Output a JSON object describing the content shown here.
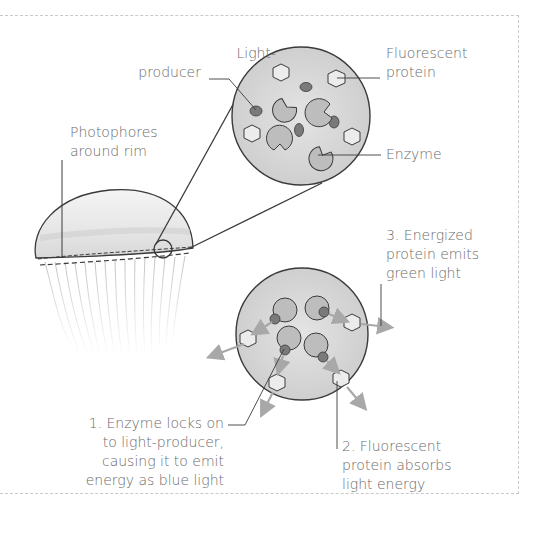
{
  "diagram": {
    "labels": {
      "light_producer": [
        "Light-",
        "producer"
      ],
      "fluorescent_protein": [
        "Fluorescent",
        "protein"
      ],
      "photophores": [
        "Photophores",
        "around rim"
      ],
      "enzyme": "Enzyme",
      "step3": [
        "3. Energized",
        "protein emits",
        "green light"
      ],
      "step1": [
        "1. Enzyme locks on",
        "to light-producer,",
        "causing it to emit",
        "energy as blue light"
      ],
      "step2": [
        "2. Fluorescent",
        "protein absorbs",
        "light energy"
      ]
    },
    "colors": {
      "outline": "#3a3a3a",
      "circle_fill": "#d4d4d4",
      "enzyme_fill": "#bdbdbd",
      "producer_fill": "#7a7a7a",
      "arrow": "#a8a8a8",
      "text": "#6b6b6b"
    }
  }
}
